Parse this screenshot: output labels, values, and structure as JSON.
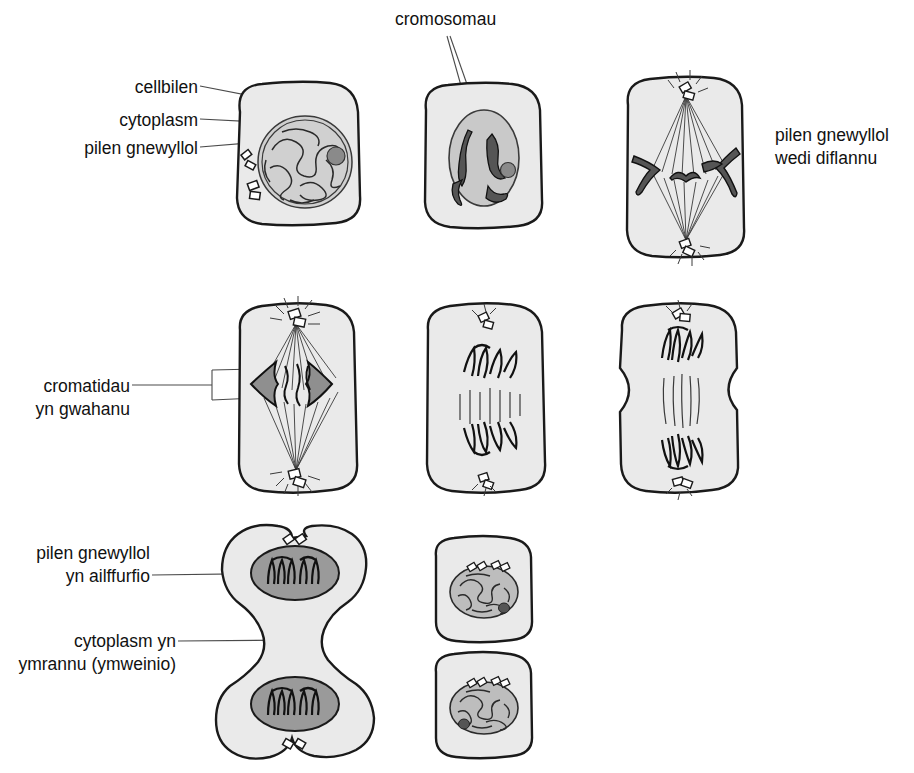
{
  "diagram": {
    "language": "Welsh",
    "colors": {
      "cytoplasm_fill": "#eaeaea",
      "nucleus_fill": "#d0d0d0",
      "nucleus_dark_fill": "#9a9a9a",
      "chromosome_fill": "#8f8f8f",
      "outline": "#1a1a1a",
      "leader_line": "#4a4a4a",
      "background": "#ffffff"
    }
  },
  "labels": {
    "cell_membrane": "cellbilen",
    "cytoplasm": "cytoplasm",
    "nuclear_membrane": "pilen gnewyllol",
    "chromosomes": "cromosomau",
    "nuclear_membrane_gone_line1": "pilen gnewyllol",
    "nuclear_membrane_gone_line2": "wedi diflannu",
    "chromatids_line1": "cromatidau",
    "chromatids_line2": "yn gwahanu",
    "nuclear_reform_line1": "pilen gnewyllol",
    "nuclear_reform_line2": "yn ailffurfio",
    "cytokinesis_line1": "cytoplasm yn",
    "cytokinesis_line2": "ymrannu (ymweinio)"
  },
  "stages": [
    {
      "id": "interphase",
      "row": 1,
      "col": 1,
      "name": "Interphase cell with chromatin network, nucleolus and centrioles"
    },
    {
      "id": "prophase",
      "row": 1,
      "col": 2,
      "name": "Prophase cell with condensed chromosomes in nucleus"
    },
    {
      "id": "prometaphase",
      "row": 1,
      "col": 3,
      "name": "Nuclear membrane dissolved, spindle forming"
    },
    {
      "id": "anaphase-early",
      "row": 2,
      "col": 1,
      "name": "Chromatids separating at the equator"
    },
    {
      "id": "anaphase-late",
      "row": 2,
      "col": 2,
      "name": "Chromatids moved to opposite poles"
    },
    {
      "id": "telophase",
      "row": 2,
      "col": 3,
      "name": "Cell pinching inward, chromosomes at poles"
    },
    {
      "id": "cytokinesis",
      "row": 3,
      "col": 1,
      "name": "Cell dividing with two reforming nuclei"
    },
    {
      "id": "daughter-top",
      "row": 3,
      "col": 2,
      "name": "Daughter cell with reformed nucleus"
    },
    {
      "id": "daughter-bottom",
      "row": 3,
      "col": 2,
      "name": "Second daughter cell with reformed nucleus"
    }
  ]
}
